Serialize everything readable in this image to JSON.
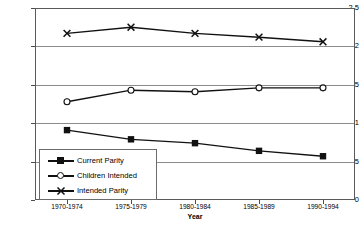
{
  "chart_data": {
    "type": "line",
    "title": "",
    "xlabel": "Year",
    "ylabel": "Average Value",
    "categories": [
      "1970-1974",
      "1975-1979",
      "1980-1984",
      "1985-1989",
      "1990-1994"
    ],
    "ylim": [
      0,
      2.5
    ],
    "yticks": [
      "0",
      "0.5",
      "1",
      "1.5",
      "2",
      "2.5"
    ],
    "ytick_values": [
      0,
      0.5,
      1,
      1.5,
      2,
      2.5
    ],
    "grid": "horizontal",
    "legend_position": "inside-bottom-left",
    "series": [
      {
        "name": "Current Parity",
        "marker": "filled-square",
        "color": "#111111",
        "values": [
          0.91,
          0.79,
          0.74,
          0.64,
          0.57
        ]
      },
      {
        "name": "Children Intended",
        "marker": "open-circle",
        "color": "#111111",
        "values": [
          1.28,
          1.43,
          1.41,
          1.46,
          1.46
        ]
      },
      {
        "name": "Intended Parity",
        "marker": "x-cross",
        "color": "#111111",
        "values": [
          2.17,
          2.25,
          2.17,
          2.12,
          2.06
        ]
      }
    ]
  },
  "axes": {
    "y_title": "Average Value",
    "x_title": "Year"
  }
}
